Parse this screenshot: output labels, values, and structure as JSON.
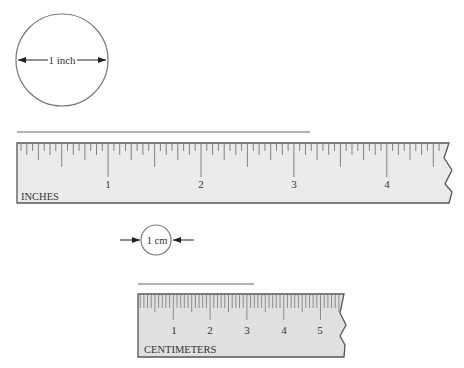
{
  "inch_circle": {
    "label": "1 inch"
  },
  "cm_circle": {
    "label": "1 cm"
  },
  "inch_ruler": {
    "unit_label": "INCHES",
    "numbers": [
      "1",
      "2",
      "3",
      "4"
    ],
    "fill": "#ebebeb",
    "line_color": "#666666"
  },
  "cm_ruler": {
    "unit_label": "CENTIMETERS",
    "numbers": [
      "1",
      "2",
      "3",
      "4",
      "5"
    ],
    "fill": "#e0e0e0",
    "line_color": "#666666"
  },
  "reference_lines": {
    "inch_line_color": "#999999",
    "cm_line_color": "#999999"
  }
}
